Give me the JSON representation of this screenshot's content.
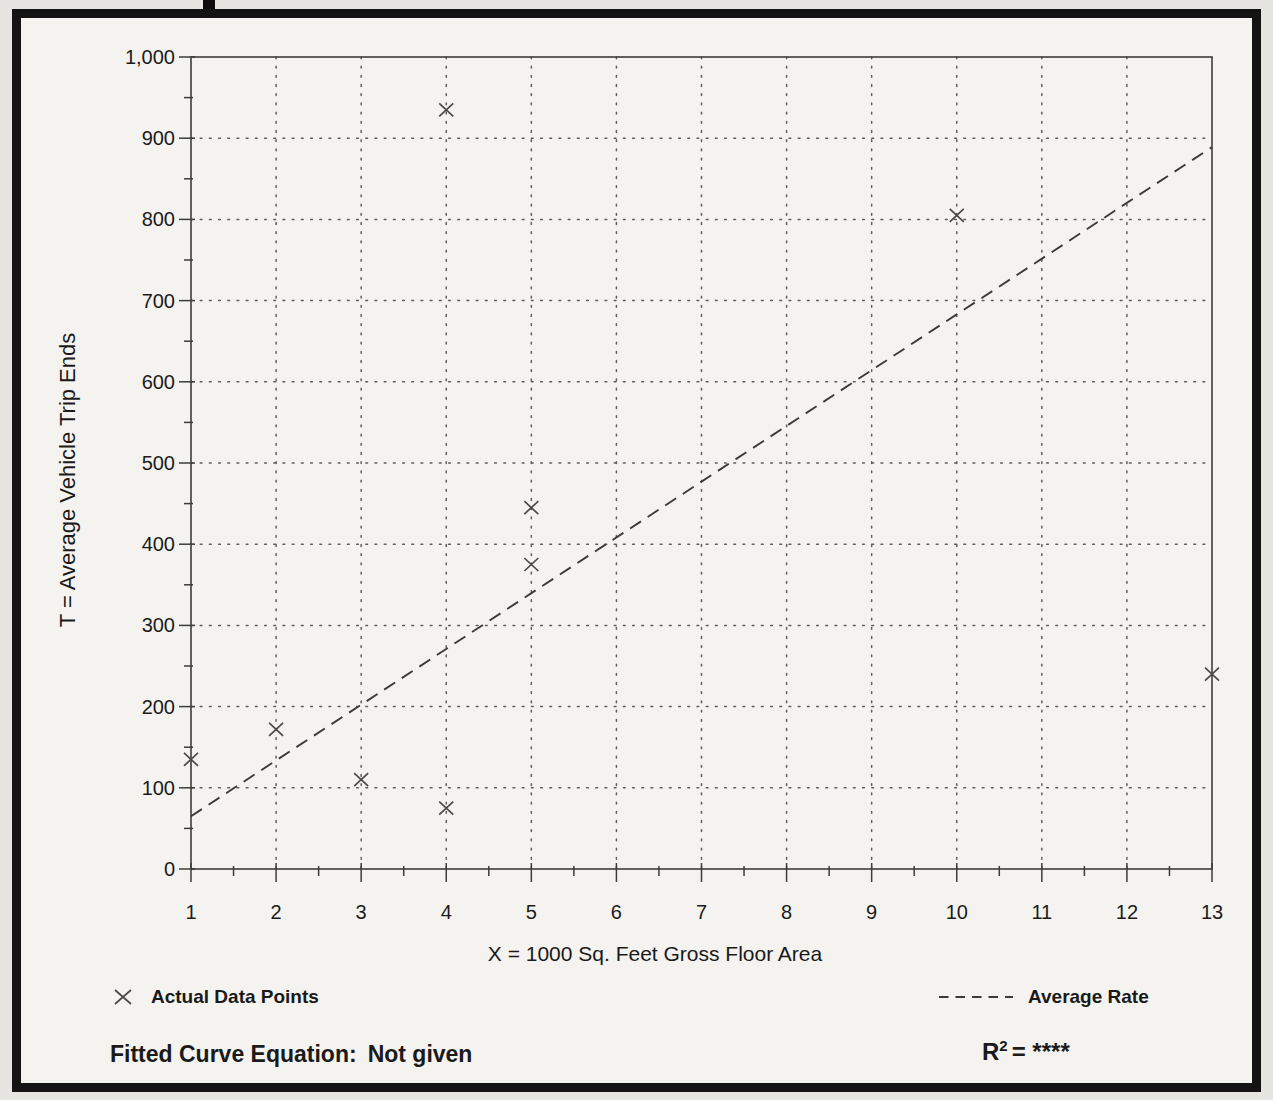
{
  "page": {
    "background": "#e7e5e1",
    "paper_color": "#f4f3ef",
    "border_color": "#141414",
    "text_color": "#1a1a1a"
  },
  "chart_data": {
    "type": "scatter",
    "title": "",
    "xlabel": "X = 1000 Sq. Feet Gross Floor Area",
    "ylabel": "T = Average Vehicle Trip Ends",
    "xlim": [
      1,
      13
    ],
    "ylim": [
      0,
      1000
    ],
    "grid": "dotted",
    "x_ticks": [
      {
        "value": 1,
        "label": "1"
      },
      {
        "value": 2,
        "label": "2"
      },
      {
        "value": 3,
        "label": "3"
      },
      {
        "value": 4,
        "label": "4"
      },
      {
        "value": 5,
        "label": "5"
      },
      {
        "value": 6,
        "label": "6"
      },
      {
        "value": 7,
        "label": "7"
      },
      {
        "value": 8,
        "label": "8"
      },
      {
        "value": 9,
        "label": "9"
      },
      {
        "value": 10,
        "label": "10"
      },
      {
        "value": 11,
        "label": "11"
      },
      {
        "value": 12,
        "label": "12"
      },
      {
        "value": 13,
        "label": "13"
      }
    ],
    "y_ticks": [
      {
        "value": 0,
        "label": "0"
      },
      {
        "value": 100,
        "label": "100"
      },
      {
        "value": 200,
        "label": "200"
      },
      {
        "value": 300,
        "label": "300"
      },
      {
        "value": 400,
        "label": "400"
      },
      {
        "value": 500,
        "label": "500"
      },
      {
        "value": 600,
        "label": "600"
      },
      {
        "value": 700,
        "label": "700"
      },
      {
        "value": 800,
        "label": "800"
      },
      {
        "value": 900,
        "label": "900"
      },
      {
        "value": 1000,
        "label": "1,000"
      }
    ],
    "x_minor_tick_step": 0.5,
    "y_minor_tick_step": 50,
    "points": [
      {
        "x": 1,
        "y": 135
      },
      {
        "x": 2,
        "y": 172
      },
      {
        "x": 3,
        "y": 110
      },
      {
        "x": 4,
        "y": 935
      },
      {
        "x": 4,
        "y": 75
      },
      {
        "x": 5,
        "y": 445
      },
      {
        "x": 5,
        "y": 375
      },
      {
        "x": 10,
        "y": 805
      },
      {
        "x": 13,
        "y": 240
      }
    ],
    "average_rate_line": {
      "x_start": 1,
      "y_start": 65,
      "x_end": 13,
      "y_end": 889
    },
    "legend": [
      {
        "marker": "x",
        "label": "Actual Data Points"
      },
      {
        "marker": "dashed-line",
        "label": "Average Rate"
      }
    ],
    "footer": {
      "equation_label": "Fitted Curve Equation:",
      "equation_value": "Not given",
      "r_base": "R",
      "r_exponent": "2",
      "r_value": "= ****"
    }
  }
}
